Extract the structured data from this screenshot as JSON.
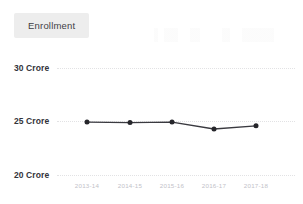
{
  "legend": {
    "position": "top-left",
    "entries": [
      {
        "label": "Enrollment",
        "swatch_color": "#ededed"
      }
    ]
  },
  "axes": {
    "y_ticks": [
      "20 Crore",
      "25 Crore",
      "30 Crore"
    ],
    "x_ticks": [
      "2013-14",
      "2014-15",
      "2015-16",
      "2016-17",
      "2017-18"
    ]
  },
  "colors": {
    "line": "#3a3a40",
    "marker": "#26262b",
    "gridline": "#e2e2e4",
    "y_tick_text": "#33333a",
    "x_tick_text": "#c2c2c8",
    "legend_background": "#ededed",
    "legend_text": "#3f3f45",
    "background": "#ffffff"
  },
  "chart_data": {
    "type": "line",
    "title": "",
    "subtitle": "",
    "xlabel": "",
    "ylabel": "",
    "unit": "Crore",
    "categories": [
      "2013-14",
      "2014-15",
      "2015-16",
      "2016-17",
      "2017-18"
    ],
    "series": [
      {
        "name": "Enrollment",
        "color": "#3a3a40",
        "marker": "circle",
        "values": [
          24.95,
          24.9,
          24.95,
          24.3,
          24.6
        ]
      }
    ],
    "ylim": [
      20,
      30
    ],
    "ytick_values": [
      20,
      25,
      30
    ],
    "ytick_labels": [
      "20 Crore",
      "25 Crore",
      "30 Crore"
    ],
    "grid": true,
    "grid_axis": "y",
    "grid_style": "dotted",
    "legend": true,
    "legend_position": "top-left"
  }
}
